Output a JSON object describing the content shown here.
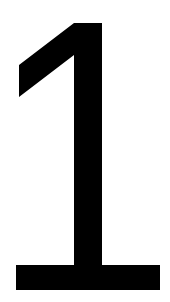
{
  "numeral": {
    "text": "1",
    "color": "#000000",
    "background": "#ffffff"
  }
}
